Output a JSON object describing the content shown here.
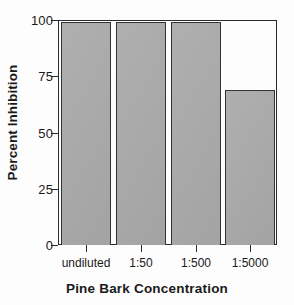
{
  "chart_data": {
    "type": "bar",
    "title": "",
    "categories": [
      "undiluted",
      "1:50",
      "1:500",
      "1:5000"
    ],
    "values": [
      99,
      99,
      99,
      69
    ],
    "xlabel": "Pine Bark Concentration",
    "ylabel": "Percent Inhibition",
    "ylim": [
      0,
      100
    ],
    "yticks": [
      0,
      25,
      50,
      75,
      100
    ],
    "ytick_labels": [
      "0",
      "25",
      "50",
      "75",
      "100"
    ],
    "grid": false,
    "legend": null,
    "bar_fill_color": "#a9a9a9",
    "bar_edge_color": "#333333",
    "axis_color": "#2b2b2b",
    "background_color": "#fdfdfd"
  }
}
